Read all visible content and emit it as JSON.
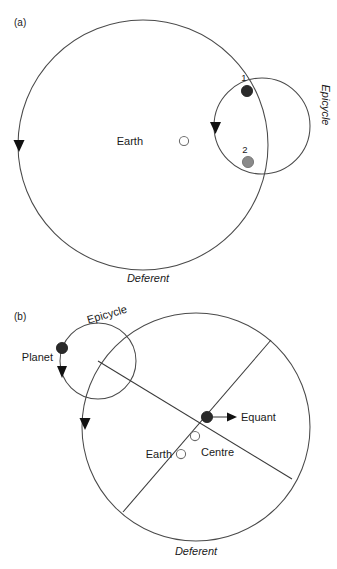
{
  "figure": {
    "background_color": "#ffffff",
    "line_color": "#4a4a4a",
    "marker_dark_color": "#2a2a2a",
    "marker_gray_color": "#8a8a8a",
    "marker_open_color": "#ffffff"
  },
  "panels": [
    {
      "id": "a",
      "panel_label": "(a)",
      "labels": {
        "earth": "Earth",
        "deferent": "Deferent",
        "epicycle": "Epicycle",
        "point_one": "1",
        "point_two": "2"
      },
      "geometry": {
        "deferent": {
          "cx": 143,
          "cy": 145,
          "r": 125
        },
        "epicycle": {
          "cx": 262,
          "cy": 126,
          "r": 48
        },
        "earth_marker": {
          "cx": 184,
          "cy": 141,
          "r": 5
        },
        "point_one_marker": {
          "cx": 247,
          "cy": 91,
          "r": 6
        },
        "point_two_marker": {
          "cx": 248,
          "cy": 162,
          "r": 6
        },
        "deferent_arrow": {
          "x": 19,
          "y": 145,
          "direction": "down"
        },
        "epicycle_arrow": {
          "x": 215,
          "y": 128,
          "direction": "down"
        }
      }
    },
    {
      "id": "b",
      "panel_label": "(b)",
      "labels": {
        "planet": "Planet",
        "epicycle": "Epicycle",
        "equant": "Equant",
        "centre": "Centre",
        "earth": "Earth",
        "deferent": "Deferent"
      },
      "geometry": {
        "deferent": {
          "cx": 196,
          "cy": 427,
          "r": 114
        },
        "epicycle": {
          "cx": 98,
          "cy": 361,
          "r": 38
        },
        "planet_marker": {
          "cx": 62,
          "cy": 348,
          "r": 6
        },
        "equant_marker": {
          "cx": 207,
          "cy": 417,
          "r": 6
        },
        "centre_marker": {
          "cx": 195,
          "cy": 436,
          "r": 5
        },
        "earth_marker": {
          "cx": 181,
          "cy": 454,
          "r": 5
        },
        "deferent_arrow": {
          "x": 85,
          "y": 423,
          "direction": "down"
        },
        "planet_arrow": {
          "x": 62,
          "y": 371,
          "direction": "down"
        },
        "equant_arrow": {
          "x": 232,
          "y": 417,
          "direction": "right"
        },
        "apsidal_line": {
          "x1": 123,
          "y1": 512,
          "x2": 271,
          "y2": 340
        },
        "radius_line": {
          "x1": 98,
          "y1": 361,
          "x2": 292,
          "y2": 479
        }
      }
    }
  ]
}
